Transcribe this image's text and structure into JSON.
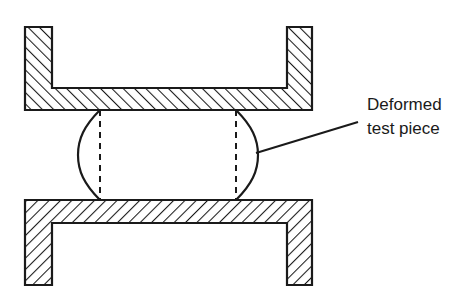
{
  "figure": {
    "background_color": "#ffffff",
    "line_color": "#1a1a1a",
    "hatch_color": "#1a1a1a"
  },
  "annotation": {
    "label_line_1": "Deformed",
    "label_line_2": "test piece",
    "leader_from": "x=258,y=152",
    "leader_to": "x=358,y=122"
  },
  "parts": {
    "upper_die": {
      "name": "Upper die",
      "shape": "inverted-U channel",
      "hatch_direction": "forward-slash",
      "left_leg_x": [
        25,
        52
      ],
      "right_leg_x": [
        287,
        312
      ],
      "top_y": 27,
      "bottom_y": 110
    },
    "lower_die": {
      "name": "Lower die",
      "shape": "U channel",
      "hatch_direction": "back-slash",
      "left_leg_x": [
        25,
        52
      ],
      "right_leg_x": [
        287,
        312
      ],
      "top_y": 200,
      "bottom_y": 285
    },
    "test_piece": {
      "name": "Deformed test piece",
      "shape": "barrelled cylinder",
      "contact_left_x": 100,
      "contact_right_x": 236,
      "bulge_left_x": 75,
      "bulge_right_x": 258,
      "top_y": 110,
      "bottom_y": 200,
      "centerline_style": "dashed"
    }
  }
}
